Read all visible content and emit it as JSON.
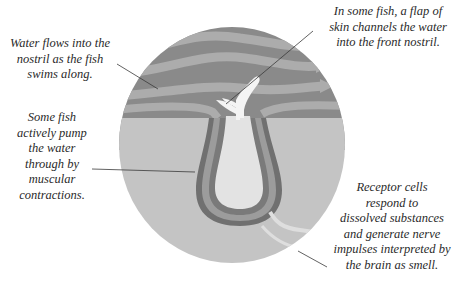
{
  "diagram": {
    "colors": {
      "water_dark": "#8a8a8a",
      "water_stripe": "#a9a9a9",
      "skin": "#c2c2c2",
      "nostril_inner": "#e2e2e2",
      "channel_dark": "#6f6f6f",
      "channel_mid": "#9a9a9a",
      "flap": "#f4f4f4",
      "leader_line": "#3a3a3a"
    },
    "labels": {
      "water_flow": "Water flows into the\nnostril as the fish\nswims along.",
      "flap": "In some fish, a flap of\nskin channels the water\ninto the front nostril.",
      "pump": "Some fish\nactively pump\nthe water\nthrough by\nmuscular\ncontractions.",
      "receptor": "Receptor cells\nrespond to\ndissolved substances\nand generate nerve\nimpulses interpreted by\nthe brain as smell."
    }
  }
}
